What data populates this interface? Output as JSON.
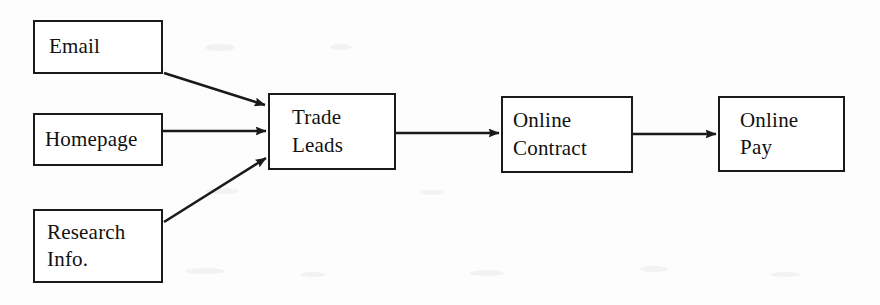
{
  "diagram": {
    "type": "flowchart",
    "orientation": "left-to-right",
    "background_color": "#fdfdfd",
    "stroke_color": "#1a1a1a",
    "text_color": "#111111",
    "nodes": [
      {
        "id": "email",
        "lines": [
          "Email"
        ],
        "x": 33,
        "y": 20,
        "width": 130,
        "height": 54
      },
      {
        "id": "homepage",
        "lines": [
          "Homepage"
        ],
        "x": 33,
        "y": 113,
        "width": 130,
        "height": 53
      },
      {
        "id": "research-info",
        "lines": [
          "Research",
          "Info."
        ],
        "x": 33,
        "y": 209,
        "width": 130,
        "height": 74
      },
      {
        "id": "trade-leads",
        "lines": [
          "Trade",
          "Leads"
        ],
        "x": 268,
        "y": 93,
        "width": 128,
        "height": 77
      },
      {
        "id": "online-contract",
        "lines": [
          "Online",
          "Contract"
        ],
        "x": 501,
        "y": 96,
        "width": 132,
        "height": 77
      },
      {
        "id": "online-pay",
        "lines": [
          "Online",
          "Pay"
        ],
        "x": 718,
        "y": 96,
        "width": 127,
        "height": 76
      }
    ],
    "edges": [
      {
        "id": "email-to-trade-leads",
        "from": "email",
        "to": "trade-leads",
        "style": "diagonal-down"
      },
      {
        "id": "homepage-to-trade-leads",
        "from": "homepage",
        "to": "trade-leads",
        "style": "horizontal"
      },
      {
        "id": "research-to-trade-leads",
        "from": "research-info",
        "to": "trade-leads",
        "style": "diagonal-up"
      },
      {
        "id": "trade-leads-to-contract",
        "from": "trade-leads",
        "to": "online-contract",
        "style": "horizontal"
      },
      {
        "id": "contract-to-pay",
        "from": "online-contract",
        "to": "online-pay",
        "style": "horizontal"
      }
    ]
  }
}
